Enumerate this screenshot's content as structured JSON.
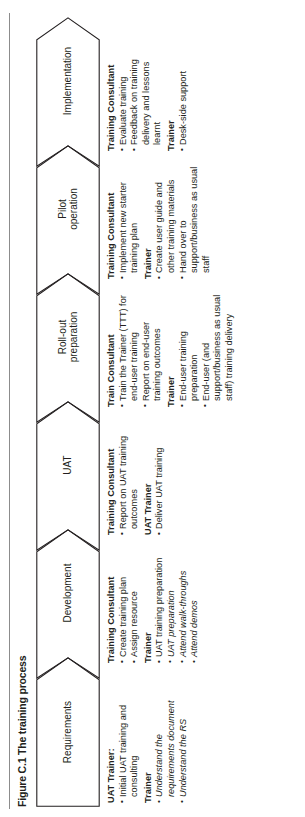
{
  "figure": {
    "title": "Figure C.1 The training process",
    "accent": "#231f20",
    "rule_color": "#8c8c8c"
  },
  "stages": [
    {
      "id": "requirements",
      "label": "Requirements"
    },
    {
      "id": "development",
      "label": "Development"
    },
    {
      "id": "uat",
      "label": "UAT"
    },
    {
      "id": "roll-out-preparation",
      "label": "Roll-out\npreparation"
    },
    {
      "id": "pilot-operation",
      "label": "Pilot\noperation"
    },
    {
      "id": "implementation",
      "label": "Implementation"
    }
  ],
  "columns": [
    {
      "id": "requirements",
      "groups": [
        {
          "role": "UAT Trainer:",
          "items": [
            {
              "text": "Initial UAT training and consulting",
              "italic": false
            }
          ]
        },
        {
          "role": "Trainer",
          "items": [
            {
              "text": "Understand the requirements document",
              "italic": true
            },
            {
              "text": "Understand the RS",
              "italic": true
            }
          ]
        }
      ]
    },
    {
      "id": "development",
      "groups": [
        {
          "role": "Training Consultant",
          "items": [
            {
              "text": "Create training plan",
              "italic": false
            },
            {
              "text": "Assign resource",
              "italic": false
            }
          ]
        },
        {
          "role": "Trainer",
          "items": [
            {
              "text": "UAT training preparation",
              "italic": false
            },
            {
              "text": "UAT preparation",
              "italic": true
            },
            {
              "text": "Attend walk-throughs",
              "italic": true
            },
            {
              "text": "Attend demos",
              "italic": true
            }
          ]
        }
      ]
    },
    {
      "id": "uat",
      "groups": [
        {
          "role": "Training Consultant",
          "items": [
            {
              "text": "Report on UAT training outcomes",
              "italic": false
            }
          ]
        },
        {
          "role": "UAT Trainer",
          "items": [
            {
              "text": "Deliver UAT training",
              "italic": false
            }
          ]
        }
      ]
    },
    {
      "id": "roll-out-preparation",
      "groups": [
        {
          "role": "Train Consultant",
          "items": [
            {
              "text": "Train the Trainer (TTT) for end-user training",
              "italic": false
            },
            {
              "text": "Report on end-user training outcomes",
              "italic": false
            }
          ]
        },
        {
          "role": "Trainer",
          "items": [
            {
              "text": "End-user training preparation",
              "italic": false
            },
            {
              "text": "End-user (and support/business as usual staff) training delivery",
              "italic": false
            }
          ]
        }
      ]
    },
    {
      "id": "pilot-operation",
      "groups": [
        {
          "role": "Training Consultant",
          "items": [
            {
              "text": "Implement new starter training plan",
              "italic": false
            }
          ]
        },
        {
          "role": "Trainer",
          "items": [
            {
              "text": "Create user guide and other training materials",
              "italic": false
            },
            {
              "text": "Hand over to support/business as usual staff",
              "italic": false
            }
          ]
        }
      ]
    },
    {
      "id": "implementation",
      "groups": [
        {
          "role": "Training Consultant",
          "items": [
            {
              "text": "Evaluate training",
              "italic": false
            },
            {
              "text": "Feedback on training delivery and lessons learnt",
              "italic": false
            }
          ]
        },
        {
          "role": "Trainer",
          "items": [
            {
              "text": "Desk-side support",
              "italic": false
            }
          ]
        }
      ]
    }
  ]
}
